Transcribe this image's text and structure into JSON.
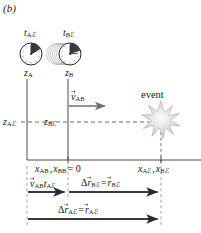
{
  "figure": {
    "panel_label": "(b)",
    "background_color": "#ffffff",
    "ink_color": "#1b1b1b",
    "accent_gray": "#8c8c8c",
    "burst_color": "#c9c9c9"
  },
  "clocks": [
    {
      "id": "clock-A",
      "time_label": "t",
      "time_sub": "Aℰ",
      "axis_label": "z",
      "axis_sub": "A",
      "shaded_fraction": 0.17,
      "trail": false,
      "cx": 31,
      "cy": 54
    },
    {
      "id": "clock-B",
      "time_label": "t",
      "time_sub": "Bℰ",
      "axis_label": "z",
      "axis_sub": "B",
      "shaded_fraction": 0.24,
      "trail": true,
      "cx": 70,
      "cy": 54
    }
  ],
  "axes": {
    "vertical_A_x": 27,
    "vertical_B_x": 68,
    "horizontal_y": 160,
    "dashed_level_y": 122,
    "left_height_label": "z",
    "left_height_sub": "Aℰ",
    "mid_height_label": "z",
    "mid_height_sub": "Bℰ"
  },
  "velocity": {
    "symbol": "v",
    "sub": "AB",
    "arrow_from_x": 69,
    "arrow_to_x": 108,
    "arrow_y": 106
  },
  "event": {
    "label": "event",
    "x": 161,
    "y": 122,
    "points": 9
  },
  "x_axis_ticks": {
    "origin_label_1": "x",
    "origin_sub_1": "AB",
    "origin_label_2": "x",
    "origin_sub_2": "BB",
    "origin_equals": "= 0",
    "right_label_1": "x",
    "right_sub_1": "Aℰ",
    "right_comma": ",",
    "right_label_2": "x",
    "right_sub_2": "Bℰ"
  },
  "measure_bars": [
    {
      "id": "bar-vt",
      "text_symbol": "v",
      "text_sub": "AB",
      "text_symbol2": "t",
      "text_sub2": "Aℰ",
      "from_x": 27,
      "to_x": 68,
      "y": 192,
      "label_y": 180
    },
    {
      "id": "bar-rBE",
      "delta": "Δ",
      "text_symbol": "r",
      "text_sub": "Bℰ",
      "equals": "=",
      "text_symbol2": "r",
      "text_sub2": "Bℰ",
      "from_x": 68,
      "to_x": 161,
      "y": 192,
      "label_y": 179
    },
    {
      "id": "bar-rAE",
      "delta": "Δ",
      "text_symbol": "r",
      "text_sub": "Aℰ",
      "equals": "=",
      "text_symbol2": "r",
      "text_sub2": "Aℰ",
      "from_x": 27,
      "to_x": 161,
      "y": 219,
      "label_y": 206
    }
  ]
}
